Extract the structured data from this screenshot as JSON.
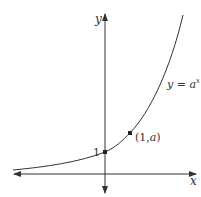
{
  "diagram": {
    "title": "",
    "type": "exponential-graph",
    "function_label": {
      "lhs": "y",
      "eq": " = ",
      "base": "a",
      "exponent": "x"
    },
    "axes": {
      "x_label": "x",
      "y_label": "y"
    },
    "points": [
      {
        "label": "1",
        "coords": [
          0,
          1
        ]
      },
      {
        "label": "(1, a)",
        "label_open": "(1,",
        "label_var": "a",
        "label_close": ")",
        "coords": [
          1,
          "a"
        ]
      }
    ],
    "colors": {
      "line": "#333333",
      "background": "#ffffff"
    }
  }
}
